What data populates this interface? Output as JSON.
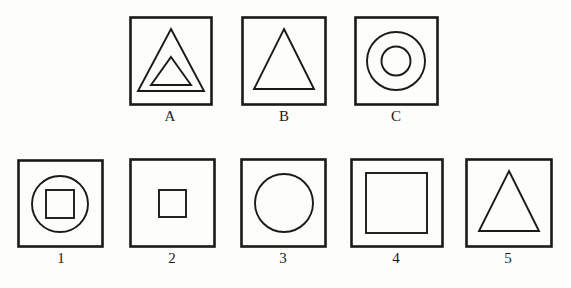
{
  "figure": {
    "kind": "shape-analogy-puzzle",
    "background_color": "#fdfdfb",
    "stroke_color": "#1a1a1a",
    "rows": [
      {
        "row_name": "problem-row",
        "panels": [
          {
            "label": "A",
            "outer_shape": "square",
            "inner_shapes": [
              "triangle",
              "triangle"
            ],
            "description": "square containing a large triangle with a smaller triangle nested inside",
            "box": {
              "x": 129,
              "y": 16,
              "w": 82,
              "h": 88
            }
          },
          {
            "label": "B",
            "outer_shape": "square",
            "inner_shapes": [
              "triangle"
            ],
            "description": "square containing a single triangle",
            "box": {
              "x": 241,
              "y": 16,
              "w": 84,
              "h": 88
            }
          },
          {
            "label": "C",
            "outer_shape": "square",
            "inner_shapes": [
              "circle",
              "circle"
            ],
            "description": "square containing two concentric circles",
            "box": {
              "x": 354,
              "y": 16,
              "w": 83,
              "h": 88
            }
          }
        ]
      },
      {
        "row_name": "answer-row",
        "panels": [
          {
            "label": "1",
            "outer_shape": "square",
            "inner_shapes": [
              "circle",
              "square"
            ],
            "description": "square containing a circle containing a small square",
            "box": {
              "x": 17,
              "y": 159,
              "w": 86,
              "h": 88
            }
          },
          {
            "label": "2",
            "outer_shape": "square",
            "inner_shapes": [
              "square"
            ],
            "description": "square containing a small square",
            "box": {
              "x": 129,
              "y": 158,
              "w": 86,
              "h": 89
            }
          },
          {
            "label": "3",
            "outer_shape": "square",
            "inner_shapes": [
              "circle"
            ],
            "description": "square containing a single circle",
            "box": {
              "x": 240,
              "y": 158,
              "w": 86,
              "h": 89
            }
          },
          {
            "label": "4",
            "outer_shape": "square",
            "inner_shapes": [
              "square"
            ],
            "description": "square containing a large square",
            "box": {
              "x": 350,
              "y": 158,
              "w": 93,
              "h": 89
            }
          },
          {
            "label": "5",
            "outer_shape": "square",
            "inner_shapes": [
              "triangle"
            ],
            "description": "square containing a triangle",
            "box": {
              "x": 465,
              "y": 158,
              "w": 87,
              "h": 89
            }
          }
        ]
      }
    ]
  }
}
